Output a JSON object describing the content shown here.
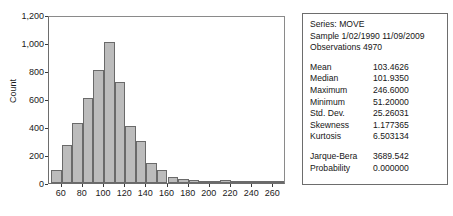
{
  "chart_data": {
    "type": "bar",
    "title": "",
    "xlabel": "",
    "ylabel": "Count",
    "xlim": [
      48,
      272
    ],
    "ylim": [
      0,
      1200
    ],
    "grid": false,
    "legend": null,
    "bin_width": 10,
    "categories": [
      "50",
      "60",
      "70",
      "80",
      "90",
      "100",
      "110",
      "120",
      "130",
      "140",
      "150",
      "160",
      "170",
      "180",
      "190",
      "200",
      "210",
      "220",
      "230",
      "240",
      "250",
      "260"
    ],
    "bin_starts": [
      50,
      60,
      70,
      80,
      90,
      100,
      110,
      120,
      130,
      140,
      150,
      160,
      170,
      180,
      190,
      200,
      210,
      220,
      230,
      240,
      250,
      260
    ],
    "values": [
      95,
      275,
      430,
      610,
      810,
      1010,
      720,
      410,
      300,
      145,
      95,
      40,
      32,
      24,
      14,
      12,
      22,
      8,
      6,
      4,
      3,
      2
    ],
    "y_ticks": [
      0,
      200,
      400,
      600,
      800,
      1000,
      1200
    ],
    "y_ticklabels": [
      "0",
      "200",
      "400",
      "600",
      "800",
      "1,000",
      "1,200"
    ],
    "x_ticks": [
      60,
      80,
      100,
      120,
      140,
      160,
      180,
      200,
      220,
      240,
      260
    ],
    "x_ticklabels": [
      "60",
      "80",
      "100",
      "120",
      "140",
      "160",
      "180",
      "200",
      "220",
      "240",
      "260"
    ],
    "bar_color": "#bcbcbc",
    "bar_edge_color": "#6a6a6a"
  },
  "stats_panel": {
    "series_line": "Series: MOVE",
    "sample_line": "Sample 1/02/1990 11/09/2009",
    "observations_line": "Observations 4970",
    "rows": [
      {
        "key": "Mean",
        "value": "103.4626"
      },
      {
        "key": "Median",
        "value": "101.9350"
      },
      {
        "key": "Maximum",
        "value": "246.6000"
      },
      {
        "key": "Minimum",
        "value": "51.20000"
      },
      {
        "key": "Std. Dev.",
        "value": "25.26031"
      },
      {
        "key": "Skewness",
        "value": "1.177365"
      },
      {
        "key": "Kurtosis",
        "value": "6.503134"
      }
    ],
    "test_rows": [
      {
        "key": "Jarque-Bera",
        "value": "3689.542"
      },
      {
        "key": "Probability",
        "value": "0.000000"
      }
    ]
  }
}
